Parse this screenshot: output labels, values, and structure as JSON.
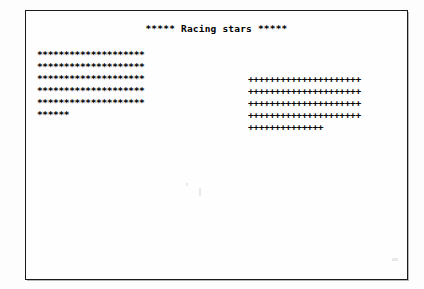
{
  "window": {
    "title": "Racing stars"
  },
  "screen": {
    "title_line": "***** Racing stars *****",
    "left_column": {
      "label": "asterisk-racer",
      "glyph": "*",
      "rows": [
        "********************",
        "********************",
        "********************",
        "********************",
        "********************",
        "******"
      ],
      "row_lengths": [
        20,
        20,
        20,
        20,
        20,
        6
      ],
      "start_line": 1
    },
    "right_column": {
      "label": "plus-racer",
      "glyph": "+",
      "rows": [
        "+++++++++++++++++++++",
        "+++++++++++++++++++++",
        "+++++++++++++++++++++",
        "+++++++++++++++++++++",
        "++++++++++++++"
      ],
      "row_lengths": [
        21,
        21,
        21,
        21,
        14
      ],
      "start_line": 3
    }
  },
  "colors": {
    "ink": "#000000",
    "paper": "#fefefe",
    "frame": "#1a1a1a"
  }
}
